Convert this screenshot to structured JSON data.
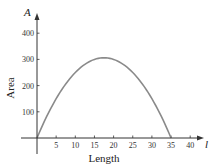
{
  "chart_data": {
    "type": "line",
    "title": "",
    "xlabel": "Length",
    "ylabel": "Area",
    "x_axis_variable": "l",
    "y_axis_variable": "A",
    "xlim": [
      0,
      45
    ],
    "ylim": [
      0,
      450
    ],
    "x_ticks": [
      5,
      10,
      15,
      20,
      25,
      30,
      35,
      40
    ],
    "y_ticks": [
      100,
      200,
      300,
      400
    ],
    "grid": false,
    "legend": null,
    "series": [
      {
        "name": "A = l(35 - l)",
        "color": "#8a8a8a",
        "x": [
          0,
          2.5,
          5,
          7.5,
          10,
          12.5,
          15,
          17.5,
          20,
          22.5,
          25,
          27.5,
          30,
          32.5,
          35
        ],
        "values": [
          0,
          81.25,
          150,
          206.25,
          250,
          281.25,
          300,
          306.25,
          300,
          281.25,
          250,
          206.25,
          150,
          81.25,
          0
        ]
      }
    ]
  },
  "colors": {
    "axis": "#333333",
    "curve": "#8a8a8a",
    "background": "#ffffff"
  }
}
